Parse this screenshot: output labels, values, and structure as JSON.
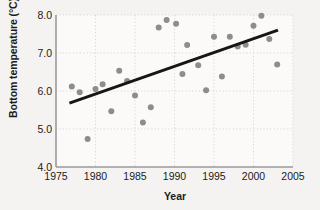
{
  "chart_data": {
    "type": "scatter",
    "title": "",
    "xlabel": "Year",
    "ylabel": "Bottom temperature (°C)",
    "xlim": [
      1975,
      2005
    ],
    "ylim": [
      4.0,
      8.0
    ],
    "xticks": [
      1975,
      1980,
      1985,
      1990,
      1995,
      2000,
      2005
    ],
    "yticks": [
      "4.0",
      "5.0",
      "6.0",
      "7.0",
      "8.0"
    ],
    "grid": true,
    "grid_style": "dotted",
    "legend": "none",
    "point_color": "#8d8d8d",
    "trend_color": "#161616",
    "axis_color": "#9a9a9a",
    "series": [
      {
        "name": "Bottom temperature",
        "marker": "circle",
        "points": [
          {
            "x": 1977.0,
            "y": 6.12
          },
          {
            "x": 1978.0,
            "y": 5.97
          },
          {
            "x": 1979.0,
            "y": 4.74
          },
          {
            "x": 1980.0,
            "y": 6.05
          },
          {
            "x": 1980.9,
            "y": 6.18
          },
          {
            "x": 1982.0,
            "y": 5.47
          },
          {
            "x": 1983.0,
            "y": 6.53
          },
          {
            "x": 1984.0,
            "y": 6.26
          },
          {
            "x": 1985.0,
            "y": 5.88
          },
          {
            "x": 1986.0,
            "y": 5.17
          },
          {
            "x": 1987.0,
            "y": 5.57
          },
          {
            "x": 1988.0,
            "y": 7.67
          },
          {
            "x": 1989.0,
            "y": 7.87
          },
          {
            "x": 1990.2,
            "y": 7.77
          },
          {
            "x": 1991.0,
            "y": 6.45
          },
          {
            "x": 1991.6,
            "y": 7.21
          },
          {
            "x": 1993.0,
            "y": 6.68
          },
          {
            "x": 1994.0,
            "y": 6.02
          },
          {
            "x": 1995.0,
            "y": 7.43
          },
          {
            "x": 1996.0,
            "y": 6.38
          },
          {
            "x": 1997.0,
            "y": 7.43
          },
          {
            "x": 1998.0,
            "y": 7.17
          },
          {
            "x": 1999.0,
            "y": 7.22
          },
          {
            "x": 2000.0,
            "y": 7.72
          },
          {
            "x": 2001.0,
            "y": 7.98
          },
          {
            "x": 2002.0,
            "y": 7.37
          },
          {
            "x": 2003.0,
            "y": 6.7
          }
        ]
      }
    ],
    "trendline": {
      "name": "linear trend",
      "x_start": 1976.7,
      "y_start": 5.68,
      "x_end": 2003.1,
      "y_end": 7.6
    }
  },
  "caption": ""
}
